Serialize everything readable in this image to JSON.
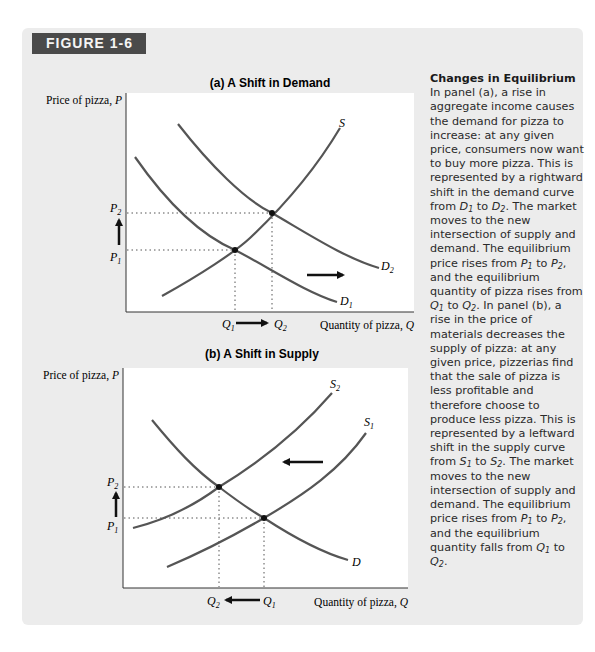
{
  "figure": {
    "label": "FIGURE 1-6",
    "tab_color": "#4a4a4a",
    "panel_bg": "#ececec"
  },
  "caption": {
    "title": "Changes in Equilibrium",
    "segments": [
      "In panel (a), a rise in aggregate income causes the demand for pizza to increase: at any given price, consumers now want to buy more pizza. This is represented by a rightward shift in the demand curve from ",
      "D1",
      " to ",
      "D2",
      ". The market moves to the new intersection of supply and demand. The equilibrium price rises from ",
      "P1",
      " to ",
      "P2",
      ", and the equilibrium quantity of pizza rises from ",
      "Q1",
      " to ",
      "Q2",
      ". In panel (b), a rise in the price of materials decreases the supply of pizza: at any given price, pizzerias find that the sale of pizza is less profitable and therefore choose to produce less pizza. This is represented by a leftward shift in the supply curve from ",
      "S1",
      " to ",
      "S2",
      ". The market moves to the new intersection of supply and demand. The equilibrium price rises from ",
      "P1",
      " to ",
      "P2",
      ", and the equilibrium quantity falls from ",
      "Q1",
      " to ",
      "Q2",
      "."
    ]
  },
  "chart_data": [
    {
      "type": "line",
      "title": "(a) A Shift in Demand",
      "ylabel": "Price of pizza, P",
      "xlabel": "Quantity of pizza, Q",
      "grid": false,
      "series": [
        {
          "name": "S",
          "kind": "supply",
          "points": [
            [
              162,
              296
            ],
            [
              200,
              270
            ],
            [
              235,
              250
            ],
            [
              272,
              213
            ],
            [
              310,
              165
            ],
            [
              340,
              128
            ]
          ]
        },
        {
          "name": "D1",
          "kind": "demand",
          "points": [
            [
              135,
              157
            ],
            [
              180,
              210
            ],
            [
              235,
              250
            ],
            [
              290,
              283
            ],
            [
              337,
              302
            ]
          ]
        },
        {
          "name": "D2",
          "kind": "demand",
          "points": [
            [
              178,
              124
            ],
            [
              225,
              175
            ],
            [
              272,
              213
            ],
            [
              330,
              247
            ],
            [
              379,
              268
            ]
          ]
        }
      ],
      "equilibria": [
        {
          "label": "E1",
          "x": 235,
          "y": 250,
          "price": "P1",
          "quantity": "Q1"
        },
        {
          "label": "E2",
          "x": 272,
          "y": 213,
          "price": "P2",
          "quantity": "Q2"
        }
      ],
      "price_ticks": [
        "P2",
        "P1"
      ],
      "quantity_ticks": [
        "Q1",
        "Q2"
      ],
      "shift_arrow": "rightward",
      "price_change": "up",
      "quantity_change": "Q1 → Q2 (increase)"
    },
    {
      "type": "line",
      "title": "(b) A Shift in Supply",
      "ylabel": "Price of pizza, P",
      "xlabel": "Quantity of pizza, Q",
      "grid": false,
      "series": [
        {
          "name": "D",
          "kind": "demand",
          "points": [
            [
              152,
              420
            ],
            [
              185,
              455
            ],
            [
              219,
              487
            ],
            [
              264,
              518
            ],
            [
              305,
              543
            ],
            [
              348,
              560
            ]
          ]
        },
        {
          "name": "S2",
          "kind": "supply",
          "points": [
            [
              133,
              528
            ],
            [
              180,
              510
            ],
            [
              219,
              487
            ],
            [
              275,
              448
            ],
            [
              332,
              393
            ]
          ]
        },
        {
          "name": "S1",
          "kind": "supply",
          "points": [
            [
              167,
              567
            ],
            [
              220,
              540
            ],
            [
              264,
              518
            ],
            [
              320,
              480
            ],
            [
              366,
              433
            ]
          ]
        }
      ],
      "equilibria": [
        {
          "label": "E1",
          "x": 264,
          "y": 518,
          "price": "P1",
          "quantity": "Q1"
        },
        {
          "label": "E2",
          "x": 219,
          "y": 487,
          "price": "P2",
          "quantity": "Q2"
        }
      ],
      "price_ticks": [
        "P2",
        "P1"
      ],
      "quantity_ticks": [
        "Q2",
        "Q1"
      ],
      "shift_arrow": "leftward",
      "price_change": "up",
      "quantity_change": "Q1 → Q2 (decrease)"
    }
  ],
  "labels": {
    "panel_a_title": "(a) A Shift in Demand",
    "panel_b_title": "(b) A Shift in Supply",
    "ylabel": "Price of pizza, P",
    "ylabel_text": "Price of pizza, ",
    "xlabel_text": "Quantity of pizza, ",
    "axis_var_p": "P",
    "axis_var_q": "Q"
  }
}
